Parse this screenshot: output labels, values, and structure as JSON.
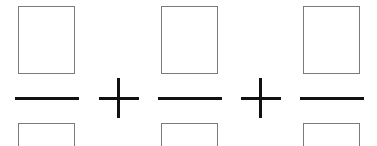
{
  "expression": {
    "description": "Sum of three fractions with empty numerator and denominator boxes",
    "fractions": [
      {
        "numerator": "",
        "denominator": ""
      },
      {
        "numerator": "",
        "denominator": ""
      },
      {
        "numerator": "",
        "denominator": ""
      }
    ],
    "operators": [
      "+",
      "+"
    ]
  },
  "colors": {
    "box_border": "#7a7a7a",
    "line": "#111111",
    "background": "#ffffff"
  }
}
